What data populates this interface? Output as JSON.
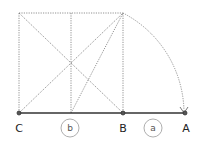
{
  "diagram": {
    "points": [
      {
        "label": "C"
      },
      {
        "label": "B"
      },
      {
        "label": "A"
      }
    ],
    "segments": [
      {
        "label": "b"
      },
      {
        "label": "a"
      }
    ]
  }
}
